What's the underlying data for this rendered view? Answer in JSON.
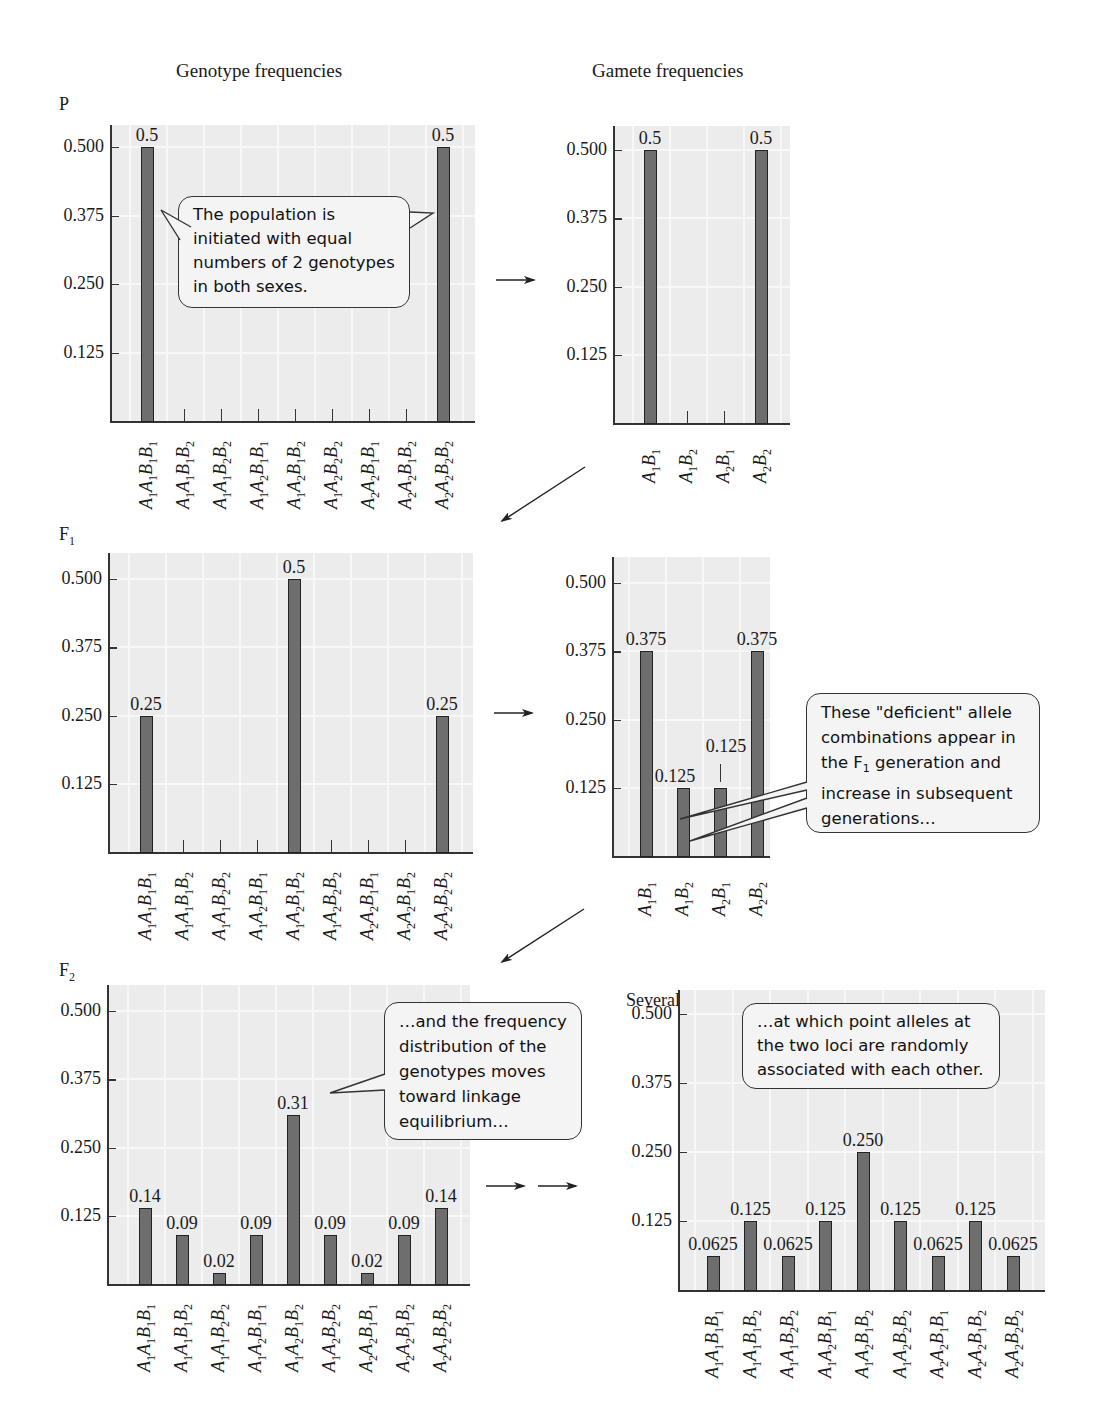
{
  "headings": {
    "genotype": "Genotype frequencies",
    "gamete": "Gamete frequencies",
    "later": "Several generations later"
  },
  "generation_labels": {
    "P": "P",
    "F1_base": "F",
    "F1_sub": "1",
    "F2_base": "F",
    "F2_sub": "2"
  },
  "y_ticks": [
    "0.500",
    "0.375",
    "0.250",
    "0.125"
  ],
  "genotype_categories": [
    [
      "A",
      "1",
      "A",
      "1",
      "B",
      "1",
      "B",
      "1"
    ],
    [
      "A",
      "1",
      "A",
      "1",
      "B",
      "1",
      "B",
      "2"
    ],
    [
      "A",
      "1",
      "A",
      "1",
      "B",
      "2",
      "B",
      "2"
    ],
    [
      "A",
      "1",
      "A",
      "2",
      "B",
      "1",
      "B",
      "1"
    ],
    [
      "A",
      "1",
      "A",
      "2",
      "B",
      "1",
      "B",
      "2"
    ],
    [
      "A",
      "1",
      "A",
      "2",
      "B",
      "2",
      "B",
      "2"
    ],
    [
      "A",
      "2",
      "A",
      "2",
      "B",
      "1",
      "B",
      "1"
    ],
    [
      "A",
      "2",
      "A",
      "2",
      "B",
      "1",
      "B",
      "2"
    ],
    [
      "A",
      "2",
      "A",
      "2",
      "B",
      "2",
      "B",
      "2"
    ]
  ],
  "gamete_categories": [
    [
      "A",
      "1",
      "B",
      "1"
    ],
    [
      "A",
      "1",
      "B",
      "2"
    ],
    [
      "A",
      "2",
      "B",
      "1"
    ],
    [
      "A",
      "2",
      "B",
      "2"
    ]
  ],
  "callouts": {
    "p": "The population is initiated with equal numbers of 2 genotypes in both sexes.",
    "f1_l1": "These \"deficient\" allele",
    "f1_l2": "combinations appear in",
    "f1_l3a": "the F",
    "f1_l3sub": "1",
    "f1_l3b": " generation and",
    "f1_l4": "increase in subsequent",
    "f1_l5": "generations…",
    "f2": "…and the frequency distribution of the genotypes moves toward linkage equilibrium…",
    "later": "…at which point alleles at the two loci are randomly associated with each other."
  },
  "chart_data": [
    {
      "id": "P_genotype",
      "type": "bar",
      "title": "Genotype frequencies — P",
      "categories": [
        "A1A1B1B1",
        "A1A1B1B2",
        "A1A1B2B2",
        "A1A2B1B1",
        "A1A2B1B2",
        "A1A2B2B2",
        "A2A2B1B1",
        "A2A2B1B2",
        "A2A2B2B2"
      ],
      "values": [
        0.5,
        0,
        0,
        0,
        0,
        0,
        0,
        0,
        0.5
      ],
      "labels": [
        "0.5",
        "",
        "",
        "",
        "",
        "",
        "",
        "",
        "0.5"
      ],
      "yticks": [
        0.125,
        0.25,
        0.375,
        0.5
      ],
      "ylim": [
        0,
        0.55
      ],
      "grid": true
    },
    {
      "id": "P_gamete",
      "type": "bar",
      "title": "Gamete frequencies — P",
      "categories": [
        "A1B1",
        "A1B2",
        "A2B1",
        "A2B2"
      ],
      "values": [
        0.5,
        0,
        0,
        0.5
      ],
      "labels": [
        "0.5",
        "",
        "",
        "0.5"
      ],
      "yticks": [
        0.125,
        0.25,
        0.375,
        0.5
      ],
      "ylim": [
        0,
        0.55
      ],
      "grid": true
    },
    {
      "id": "F1_genotype",
      "type": "bar",
      "title": "Genotype frequencies — F1",
      "categories": [
        "A1A1B1B1",
        "A1A1B1B2",
        "A1A1B2B2",
        "A1A2B1B1",
        "A1A2B1B2",
        "A1A2B2B2",
        "A2A2B1B1",
        "A2A2B1B2",
        "A2A2B2B2"
      ],
      "values": [
        0.25,
        0,
        0,
        0,
        0.5,
        0,
        0,
        0,
        0.25
      ],
      "labels": [
        "0.25",
        "",
        "",
        "",
        "0.5",
        "",
        "",
        "",
        "0.25"
      ],
      "yticks": [
        0.125,
        0.25,
        0.375,
        0.5
      ],
      "ylim": [
        0,
        0.55
      ],
      "grid": true
    },
    {
      "id": "F1_gamete",
      "type": "bar",
      "title": "Gamete frequencies — F1",
      "categories": [
        "A1B1",
        "A1B2",
        "A2B1",
        "A2B2"
      ],
      "values": [
        0.375,
        0.125,
        0.125,
        0.375
      ],
      "labels": [
        "0.375",
        "0.125",
        "0.125",
        "0.375"
      ],
      "yticks": [
        0.125,
        0.25,
        0.375,
        0.5
      ],
      "ylim": [
        0,
        0.55
      ],
      "grid": true
    },
    {
      "id": "F2_genotype",
      "type": "bar",
      "title": "Genotype frequencies — F2",
      "categories": [
        "A1A1B1B1",
        "A1A1B1B2",
        "A1A1B2B2",
        "A1A2B1B1",
        "A1A2B1B2",
        "A1A2B2B2",
        "A2A2B1B1",
        "A2A2B1B2",
        "A2A2B2B2"
      ],
      "values": [
        0.14,
        0.09,
        0.02,
        0.09,
        0.31,
        0.09,
        0.02,
        0.09,
        0.14
      ],
      "labels": [
        "0.14",
        "0.09",
        "0.02",
        "0.09",
        "0.31",
        "0.09",
        "0.02",
        "0.09",
        "0.14"
      ],
      "yticks": [
        0.125,
        0.25,
        0.375,
        0.5
      ],
      "ylim": [
        0,
        0.55
      ],
      "grid": true
    },
    {
      "id": "later_genotype",
      "type": "bar",
      "title": "Several generations later",
      "categories": [
        "A1A1B1B1",
        "A1A1B1B2",
        "A1A1B2B2",
        "A1A2B1B1",
        "A1A2B1B2",
        "A1A2B2B2",
        "A2A2B1B1",
        "A2A2B1B2",
        "A2A2B2B2"
      ],
      "values": [
        0.0625,
        0.125,
        0.0625,
        0.125,
        0.25,
        0.125,
        0.0625,
        0.125,
        0.0625
      ],
      "labels": [
        "0.0625",
        "0.125",
        "0.0625",
        "0.125",
        "0.250",
        "0.125",
        "0.0625",
        "0.125",
        "0.0625"
      ],
      "yticks": [
        0.125,
        0.25,
        0.375,
        0.5
      ],
      "ylim": [
        0,
        0.55
      ],
      "grid": true
    }
  ]
}
